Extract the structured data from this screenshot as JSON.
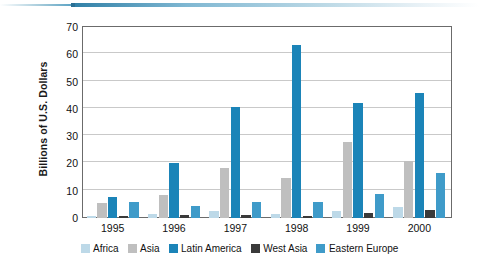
{
  "chart_data": {
    "type": "bar",
    "title": "",
    "subtitle": "",
    "xlabel": "",
    "ylabel": "Billions of U.S. Dollars",
    "categories": [
      "1995",
      "1996",
      "1997",
      "1998",
      "1999",
      "2000"
    ],
    "ylim": [
      0,
      70
    ],
    "yticks": [
      "0",
      "10",
      "20",
      "30",
      "40",
      "50",
      "60",
      "70"
    ],
    "ytick_values": [
      0,
      10,
      20,
      30,
      40,
      50,
      60,
      70
    ],
    "grid": true,
    "legend_position": "bottom",
    "series": [
      {
        "name": "Africa",
        "color": "#bdd9e8",
        "values": [
          0.8,
          1.5,
          2.6,
          1.5,
          2.7,
          4.0
        ]
      },
      {
        "name": "Asia",
        "color": "#bfbfbf",
        "values": [
          5.5,
          8.6,
          18.2,
          14.8,
          27.8,
          20.8
        ]
      },
      {
        "name": "Latin America",
        "color": "#1b84b8",
        "values": [
          7.8,
          20.3,
          40.8,
          63.5,
          42.3,
          45.7
        ]
      },
      {
        "name": "West Asia",
        "color": "#3a3a3a",
        "values": [
          0.8,
          1.1,
          1.2,
          0.9,
          2.0,
          2.8
        ]
      },
      {
        "name": "Eastern Europe",
        "color": "#3f9bc9",
        "values": [
          5.8,
          4.3,
          5.8,
          5.9,
          8.8,
          16.4
        ]
      }
    ]
  },
  "accent_color": "#2a6f94"
}
